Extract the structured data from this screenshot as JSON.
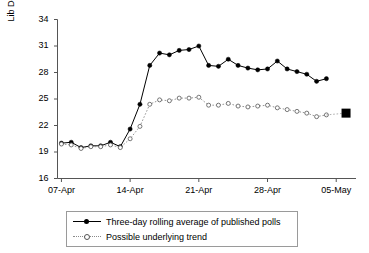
{
  "chart_data": {
    "type": "line",
    "title": "",
    "xlabel": "",
    "ylabel": "Lib Dem share (%)",
    "ylim": [
      16,
      34
    ],
    "yticks": [
      16,
      19,
      22,
      25,
      28,
      31,
      34
    ],
    "xticks": [
      "07-Apr",
      "14-Apr",
      "21-Apr",
      "28-Apr",
      "05-May"
    ],
    "xtick_days": [
      0,
      7,
      14,
      21,
      28
    ],
    "xlim_days": [
      -0.4,
      29.2
    ],
    "grid": false,
    "legend_position": "below-plot",
    "series": [
      {
        "name": "Three-day rolling average of published polls",
        "marker": "filled-circle",
        "line": "solid",
        "color": "#000000",
        "x": [
          0,
          1,
          2,
          3,
          4,
          5,
          6,
          7,
          8,
          9,
          10,
          11,
          12,
          13,
          14,
          15,
          16,
          17,
          18,
          19,
          20,
          21,
          22,
          23,
          24,
          25,
          26,
          27
        ],
        "values": [
          20.0,
          20.1,
          19.5,
          19.7,
          19.7,
          20.1,
          19.6,
          21.6,
          24.4,
          28.8,
          30.2,
          30.0,
          30.5,
          30.6,
          31.0,
          28.8,
          28.7,
          29.5,
          28.8,
          28.5,
          28.3,
          28.4,
          29.3,
          28.4,
          28.1,
          27.8,
          27.0,
          27.3
        ]
      },
      {
        "name": "Possible underlying trend",
        "marker": "open-circle",
        "line": "dotted",
        "color": "#8a8a8a",
        "x": [
          0,
          1,
          2,
          3,
          4,
          5,
          6,
          7,
          8,
          9,
          10,
          11,
          12,
          13,
          14,
          15,
          16,
          17,
          18,
          19,
          20,
          21,
          22,
          23,
          24,
          25,
          26,
          27
        ],
        "values": [
          19.9,
          19.8,
          19.4,
          19.6,
          19.6,
          19.8,
          19.5,
          20.5,
          21.9,
          24.4,
          24.9,
          24.8,
          25.1,
          25.1,
          25.2,
          24.3,
          24.3,
          24.5,
          24.2,
          24.1,
          24.2,
          24.3,
          24.0,
          23.8,
          23.6,
          23.4,
          23.0,
          23.2
        ]
      }
    ],
    "annotations": [
      {
        "name": "election-result-marker",
        "marker": "filled-square",
        "x_day": 29.0,
        "value": 23.4,
        "color": "#000000"
      }
    ]
  },
  "legend": {
    "items": [
      {
        "label": "Three-day rolling average of published polls"
      },
      {
        "label": "Possible underlying trend"
      }
    ]
  }
}
